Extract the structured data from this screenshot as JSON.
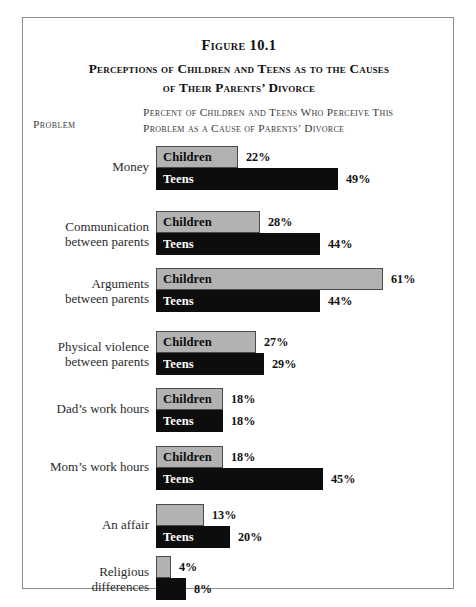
{
  "figure": {
    "number": "Figure 10.1",
    "title_line1": "Perceptions of Children and Teens as to the Causes",
    "title_line2": "of Their Parents’ Divorce",
    "column_head_problem": "Problem",
    "column_head_desc_line1": "Percent of Children and Teens Who Perceive This",
    "column_head_desc_line2": "Problem as a Cause of Parents’ Divorce"
  },
  "colors": {
    "children_fill": "#b2b2b2",
    "children_border": "#4a4a4a",
    "teens_fill": "#0d0d0d",
    "frame_border": "#8c8c8c",
    "top_rule": "#1b1b1b",
    "text": "#2b2b2b"
  },
  "chart_data": {
    "type": "bar",
    "orientation": "horizontal",
    "xlabel": "Percent of Children and Teens Who Perceive This Problem as a Cause of Parents' Divorce",
    "ylabel": "Problem",
    "xlim": [
      0,
      61
    ],
    "grid": false,
    "legend": "in-bar labels",
    "value_suffix": "%",
    "categories": [
      "Money",
      "Communication between parents",
      "Arguments between parents",
      "Physical violence between parents",
      "Dad's work hours",
      "Mom's work hours",
      "An affair",
      "Religious differences"
    ],
    "series": [
      {
        "name": "Children",
        "values": [
          22,
          28,
          61,
          27,
          18,
          18,
          13,
          4
        ]
      },
      {
        "name": "Teens",
        "values": [
          49,
          44,
          44,
          29,
          18,
          45,
          20,
          8
        ]
      }
    ]
  },
  "groups": [
    {
      "label_line1": "Money",
      "label_line2": "",
      "children": {
        "series": "Children",
        "value": 22,
        "value_label": "22%",
        "bar_text": "Children"
      },
      "teens": {
        "series": "Teens",
        "value": 49,
        "value_label": "49%",
        "bar_text": "Teens"
      }
    },
    {
      "label_line1": "Communication",
      "label_line2": "between parents",
      "children": {
        "series": "Children",
        "value": 28,
        "value_label": "28%",
        "bar_text": "Children"
      },
      "teens": {
        "series": "Teens",
        "value": 44,
        "value_label": "44%",
        "bar_text": "Teens"
      }
    },
    {
      "label_line1": "Arguments",
      "label_line2": "between parents",
      "children": {
        "series": "Children",
        "value": 61,
        "value_label": "61%",
        "bar_text": "Children"
      },
      "teens": {
        "series": "Teens",
        "value": 44,
        "value_label": "44%",
        "bar_text": "Teens"
      }
    },
    {
      "label_line1": "Physical violence",
      "label_line2": "between parents",
      "children": {
        "series": "Children",
        "value": 27,
        "value_label": "27%",
        "bar_text": "Children"
      },
      "teens": {
        "series": "Teens",
        "value": 29,
        "value_label": "29%",
        "bar_text": "Teens"
      }
    },
    {
      "label_line1": "Dad’s work hours",
      "label_line2": "",
      "children": {
        "series": "Children",
        "value": 18,
        "value_label": "18%",
        "bar_text": "Children"
      },
      "teens": {
        "series": "Teens",
        "value": 18,
        "value_label": "18%",
        "bar_text": "Teens"
      }
    },
    {
      "label_line1": "Mom’s work hours",
      "label_line2": "",
      "children": {
        "series": "Children",
        "value": 18,
        "value_label": "18%",
        "bar_text": "Children"
      },
      "teens": {
        "series": "Teens",
        "value": 45,
        "value_label": "45%",
        "bar_text": "Teens"
      }
    },
    {
      "label_line1": "An affair",
      "label_line2": "",
      "children": {
        "series": "Children",
        "value": 13,
        "value_label": "13%",
        "bar_text": ""
      },
      "teens": {
        "series": "Teens",
        "value": 20,
        "value_label": "20%",
        "bar_text": "Teens"
      }
    },
    {
      "label_line1": "Religious",
      "label_line2": "differences",
      "children": {
        "series": "Children",
        "value": 4,
        "value_label": "4%",
        "bar_text": ""
      },
      "teens": {
        "series": "Teens",
        "value": 8,
        "value_label": "8%",
        "bar_text": ""
      }
    }
  ],
  "layout": {
    "px_per_percent": 3.72,
    "bar_height": 22,
    "group_top_offsets": [
      128,
      193,
      250,
      313,
      370,
      428,
      486,
      538
    ]
  }
}
